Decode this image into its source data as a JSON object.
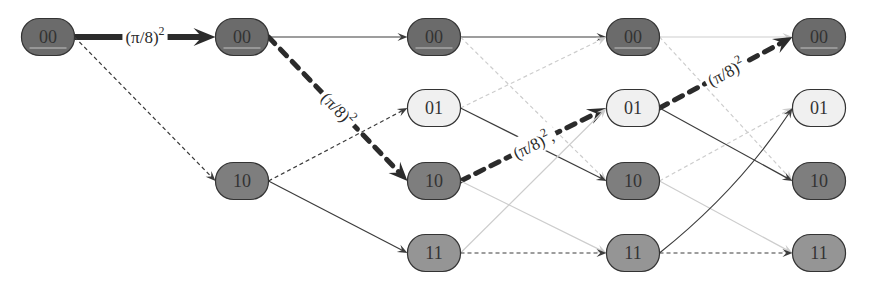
{
  "diagram": {
    "colors": {
      "state_00": "#6b6b6b",
      "state_01": "#f0f0f0",
      "state_10": "#7e7e7e",
      "state_11": "#959595",
      "node_stroke": "#333333",
      "node_text": "#333333",
      "highlight_line": "#c4c4c4",
      "edge_dark": "#3c3c3c",
      "edge_light": "#cdcdcd",
      "edge_bold": "#2b2b2b"
    },
    "columns": [
      {
        "index": 1,
        "nodes": [
          "00"
        ]
      },
      {
        "index": 2,
        "nodes": [
          "00",
          "10"
        ]
      },
      {
        "index": 3,
        "nodes": [
          "00",
          "01",
          "10",
          "11"
        ]
      },
      {
        "index": 4,
        "nodes": [
          "00",
          "01",
          "10",
          "11"
        ]
      },
      {
        "index": 5,
        "nodes": [
          "00",
          "01",
          "10",
          "11"
        ]
      }
    ],
    "edges": [
      {
        "from": [
          1,
          "00"
        ],
        "to": [
          2,
          "00"
        ],
        "style": "bold-solid",
        "label": {
          "base": "(π/8)",
          "sup": "2",
          "suffix": ""
        }
      },
      {
        "from": [
          1,
          "00"
        ],
        "to": [
          2,
          "10"
        ],
        "style": "dashed"
      },
      {
        "from": [
          2,
          "00"
        ],
        "to": [
          3,
          "00"
        ],
        "style": "solid"
      },
      {
        "from": [
          2,
          "00"
        ],
        "to": [
          3,
          "10"
        ],
        "style": "bold-dashed",
        "label": {
          "base": "(π/8)",
          "sup": "2",
          "suffix": ""
        }
      },
      {
        "from": [
          2,
          "10"
        ],
        "to": [
          3,
          "01"
        ],
        "style": "dashed"
      },
      {
        "from": [
          2,
          "10"
        ],
        "to": [
          3,
          "11"
        ],
        "style": "solid"
      },
      {
        "from": [
          3,
          "00"
        ],
        "to": [
          4,
          "00"
        ],
        "style": "solid"
      },
      {
        "from": [
          3,
          "00"
        ],
        "to": [
          4,
          "10"
        ],
        "style": "light-dashed"
      },
      {
        "from": [
          3,
          "01"
        ],
        "to": [
          4,
          "00"
        ],
        "style": "light-dashed"
      },
      {
        "from": [
          3,
          "01"
        ],
        "to": [
          4,
          "10"
        ],
        "style": "solid"
      },
      {
        "from": [
          3,
          "10"
        ],
        "to": [
          4,
          "01"
        ],
        "style": "bold-dashed",
        "label": {
          "base": "(π/8)",
          "sup": "2",
          "suffix": ","
        }
      },
      {
        "from": [
          3,
          "10"
        ],
        "to": [
          4,
          "11"
        ],
        "style": "light-solid"
      },
      {
        "from": [
          3,
          "11"
        ],
        "to": [
          4,
          "01"
        ],
        "style": "light-solid"
      },
      {
        "from": [
          3,
          "11"
        ],
        "to": [
          4,
          "11"
        ],
        "style": "dashed"
      },
      {
        "from": [
          4,
          "00"
        ],
        "to": [
          5,
          "00"
        ],
        "style": "light-solid"
      },
      {
        "from": [
          4,
          "00"
        ],
        "to": [
          5,
          "10"
        ],
        "style": "light-dashed"
      },
      {
        "from": [
          4,
          "01"
        ],
        "to": [
          5,
          "00"
        ],
        "style": "bold-dashed",
        "label": {
          "base": "(π/8)",
          "sup": "2",
          "suffix": ""
        }
      },
      {
        "from": [
          4,
          "01"
        ],
        "to": [
          5,
          "10"
        ],
        "style": "solid"
      },
      {
        "from": [
          4,
          "10"
        ],
        "to": [
          5,
          "01"
        ],
        "style": "light-dashed"
      },
      {
        "from": [
          4,
          "10"
        ],
        "to": [
          5,
          "11"
        ],
        "style": "light-solid"
      },
      {
        "from": [
          4,
          "11"
        ],
        "to": [
          5,
          "01"
        ],
        "style": "solid",
        "curved": true
      },
      {
        "from": [
          4,
          "11"
        ],
        "to": [
          5,
          "11"
        ],
        "style": "dashed"
      }
    ]
  }
}
